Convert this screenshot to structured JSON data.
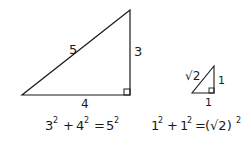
{
  "diagram": {
    "large_triangle": {
      "hypotenuse_label": "5",
      "vertical_leg_label": "3",
      "horizontal_leg_label": "4",
      "equation": {
        "a": "3",
        "b": "4",
        "c": "5",
        "exp": "2",
        "plus": "+",
        "equals": "="
      }
    },
    "small_triangle": {
      "hypotenuse_label": "√2",
      "vertical_leg_label": "1",
      "horizontal_leg_label": "1",
      "equation": {
        "a": "1",
        "b": "1",
        "c": "(√2)",
        "exp": "2",
        "plus": "+",
        "equals": "="
      }
    },
    "colors": {
      "stroke": "#1a1a1a",
      "background": "#ffffff"
    }
  }
}
